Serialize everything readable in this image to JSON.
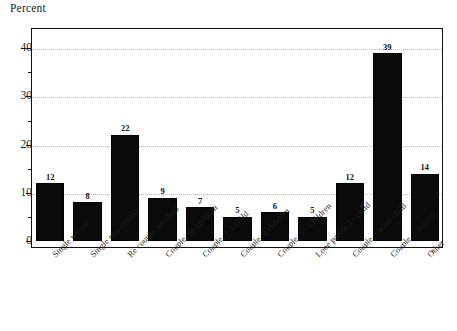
{
  "chart_data": {
    "type": "bar",
    "title": "",
    "ylabel": "Percent",
    "xlabel": "",
    "ylim": [
      0,
      45
    ],
    "yticks": [
      0,
      10,
      20,
      30,
      40
    ],
    "ytick_labels": [
      "0",
      "10",
      "20",
      "30",
      "40"
    ],
    "minor_ticks": [
      5,
      15,
      25,
      35,
      45
    ],
    "grid": "horizontal dotted gridlines at 10, 20, 30, 40",
    "legend": "none",
    "bar_color": "#0b0b0b",
    "categories": [
      "Single retired",
      "Single non-retired",
      "Re couple, no child",
      "Couple, no children",
      "Couple, + 1 child",
      "Couple, 2 children",
      "Couple, 3+ Children",
      "Lone parent,1+ child",
      "Couple,+ adult child",
      "Couple, 1 retired",
      "Other"
    ],
    "values": [
      12,
      8,
      22,
      9,
      7,
      5,
      6,
      5,
      12,
      39,
      14
    ],
    "value_labels": [
      "12",
      "8",
      "22",
      "9",
      "7",
      "5",
      "6",
      "5",
      "12",
      "39",
      "14"
    ]
  },
  "artifact": {
    "top_cut_text": ""
  }
}
